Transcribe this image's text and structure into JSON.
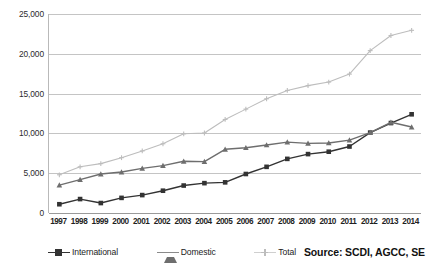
{
  "chart_data": {
    "type": "line",
    "title": "",
    "subtitle": "",
    "xlabel": "",
    "ylabel": "",
    "categories": [
      "1997",
      "1998",
      "1999",
      "2000",
      "2001",
      "2002",
      "2003",
      "2004",
      "2005",
      "2006",
      "2007",
      "2008",
      "2009",
      "2010",
      "2011",
      "2012",
      "2013",
      "2014"
    ],
    "ylim": [
      0,
      25000
    ],
    "yticks": [
      0,
      5000,
      10000,
      15000,
      20000,
      25000
    ],
    "ytick_labels": [
      "0",
      "5,000",
      "10,000",
      "15,000",
      "20,000",
      "25,000"
    ],
    "grid": true,
    "legend_position": "bottom",
    "series": [
      {
        "name": "International",
        "marker": "square",
        "color": "#333333",
        "values": [
          1100,
          1750,
          1250,
          1900,
          2250,
          2800,
          3450,
          3750,
          3850,
          4900,
          5800,
          6800,
          7400,
          7700,
          8350,
          10100,
          11300,
          12400
        ]
      },
      {
        "name": "Domestic",
        "marker": "triangle",
        "color": "#6e6e6e",
        "values": [
          3500,
          4200,
          4900,
          5150,
          5600,
          5950,
          6500,
          6450,
          8000,
          8200,
          8550,
          8900,
          8750,
          8800,
          9150,
          10100,
          11400,
          10800
        ]
      },
      {
        "name": "Total",
        "marker": "cross",
        "color": "#bdbdbd",
        "values": [
          4800,
          5800,
          6200,
          6950,
          7800,
          8700,
          9950,
          10050,
          11750,
          13050,
          14350,
          15400,
          16000,
          16450,
          17450,
          20400,
          22300,
          22950
        ]
      }
    ],
    "annotations": []
  },
  "legend": {
    "items": [
      {
        "label": "International",
        "icon": "square-marker-icon"
      },
      {
        "label": "Domestic",
        "icon": "triangle-marker-icon"
      },
      {
        "label": "Total",
        "icon": "cross-marker-icon"
      }
    ]
  },
  "source": {
    "text": "Source: SCDI, AGCC, SE"
  },
  "colors": {
    "international": "#333333",
    "domestic": "#6e6e6e",
    "total": "#bdbdbd",
    "gridline": "#c4c4c4",
    "axis": "#9a9a9a",
    "background": "#ffffff",
    "text": "#1f1f1f"
  }
}
